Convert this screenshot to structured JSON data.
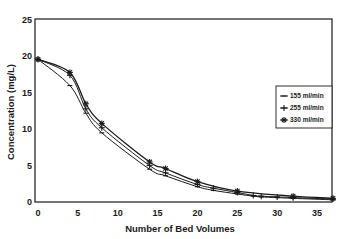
{
  "chart_data": {
    "type": "line",
    "title": "",
    "xlabel": "Number of Bed Volumes",
    "ylabel": "Concentration (mg/L)",
    "xlim": [
      0,
      37
    ],
    "ylim": [
      0,
      25
    ],
    "xticks": [
      0,
      5,
      10,
      15,
      20,
      25,
      30,
      35
    ],
    "yticks": [
      0,
      5,
      10,
      15,
      20,
      25
    ],
    "grid": false,
    "legend_position": "right",
    "series": [
      {
        "name": "155 ml/min",
        "marker": "dash",
        "x": [
          0,
          4,
          6,
          8,
          14,
          16,
          20,
          22,
          25,
          27,
          28,
          30,
          32,
          37
        ],
        "y": [
          19.6,
          16.0,
          12.2,
          9.5,
          4.5,
          3.6,
          2.1,
          1.6,
          1.1,
          0.8,
          0.7,
          0.6,
          0.5,
          0.3
        ]
      },
      {
        "name": "255 ml/min",
        "marker": "plus",
        "x": [
          0,
          4,
          6,
          8,
          14,
          16,
          20,
          22,
          25,
          27,
          28,
          30,
          32,
          37
        ],
        "y": [
          19.6,
          17.4,
          12.8,
          10.2,
          5.0,
          4.0,
          2.4,
          1.9,
          1.3,
          0.9,
          0.8,
          0.7,
          0.6,
          0.4
        ]
      },
      {
        "name": "330 ml/min",
        "marker": "asterisk",
        "x": [
          0,
          4,
          6,
          8,
          14,
          16,
          20,
          25,
          32,
          37
        ],
        "y": [
          19.6,
          17.8,
          13.5,
          10.8,
          5.5,
          4.6,
          2.8,
          1.5,
          0.8,
          0.5
        ]
      }
    ]
  }
}
